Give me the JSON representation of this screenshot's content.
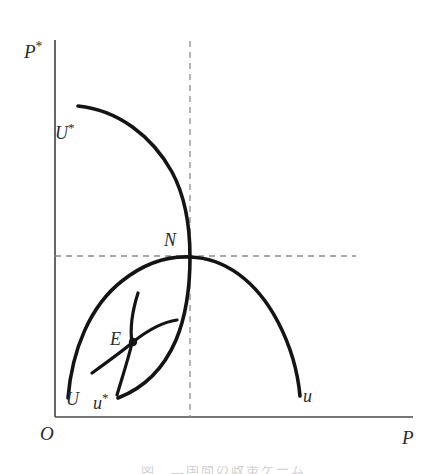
{
  "figure": {
    "background_color": "#ffffff",
    "ink_color": "#1a1a1a",
    "axis_color": "#4a4a4a",
    "dash_color": "#8a8a8a",
    "width": 446,
    "height": 474
  },
  "axes": {
    "y_label": "P",
    "y_label_star": "*",
    "x_label": "P",
    "origin_label": "O",
    "x_axis": {
      "x_start": 55,
      "x_end": 413,
      "y": 417
    },
    "y_axis": {
      "x": 55,
      "y_start": 40,
      "y_end": 417
    }
  },
  "guides": [
    {
      "name": "horizontal-guide-to-N",
      "orientation": "horizontal",
      "x_start": 55,
      "x_end": 356,
      "y": 256,
      "style": "dashed"
    },
    {
      "name": "vertical-guide-to-N",
      "orientation": "vertical",
      "x": 190,
      "y_start": 41,
      "y_end": 417,
      "style": "dashed"
    }
  ],
  "curves": [
    {
      "id": "U-star",
      "label": "U",
      "label_star": "*",
      "label_x": 55,
      "label_y": 124,
      "description": "foreign reaction / best-response curve, concave from upper-left through N",
      "path": "M 78 106 C 118 110, 152 136, 172 172 C 186 198, 190 228, 190 257 C 190 288, 186 316, 176 340 C 164 368, 144 388, 118 398",
      "stroke_width": 3.6
    },
    {
      "id": "U-u",
      "label_left": "U",
      "label_right": "u",
      "label_left_x": 66,
      "label_left_y": 392,
      "label_right_x": 303,
      "label_right_y": 389,
      "description": "home reaction / best-response curve, concave arc from lower-left through N to lower-right",
      "path": "M 68 398 C 72 350, 90 306, 122 281 C 146 262, 170 256, 190 257 C 224 258, 256 280, 278 322 C 291 347, 298 374, 300 396",
      "stroke_width": 3.6
    },
    {
      "id": "u-star-indifference",
      "label": "u",
      "label_star": "*",
      "label_x": 93,
      "label_y": 396,
      "description": "small indifference arc through E, running top to lower-left",
      "path": "M 138 293 C 132 312, 130 330, 132 343 C 128 360, 122 378, 117 395",
      "stroke_width": 3.2
    },
    {
      "id": "U-indifference",
      "description": "small indifference arc through E, running lower-left to right",
      "path": "M 92 373 C 110 360, 124 350, 133 342 C 148 330, 162 322, 177 320",
      "stroke_width": 3.2
    }
  ],
  "points": [
    {
      "id": "N",
      "label": "N",
      "x": 190,
      "y": 257,
      "label_x": 164,
      "label_y": 232,
      "dot": false
    },
    {
      "id": "E",
      "label": "E",
      "x": 133,
      "y": 342,
      "label_x": 110,
      "label_y": 331,
      "dot": true
    }
  ],
  "caption": {
    "partial_text": "図　二国間の政策ゲーム",
    "visible": "clipped at bottom edge"
  }
}
